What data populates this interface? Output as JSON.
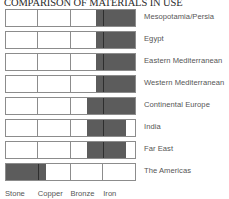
{
  "chart_data": {
    "type": "bar",
    "title": "COMPARISON OF MATERIALS IN USE",
    "xlabel": "",
    "ylabel": "",
    "grid": false,
    "legend_position": "bottom-axis",
    "segment_labels": [
      "Stone",
      "Copper",
      "Bronze",
      "Iron"
    ],
    "categories": [
      "Mesopotamia/Persia",
      "Egypt",
      "Eastern Mediterranean",
      "Western Mediterranean",
      "Continental Europe",
      "India",
      "Far East",
      "The Americas"
    ],
    "axis_range_percent": [
      0,
      100
    ],
    "series": [
      {
        "name": "Iron (dark fill extent, % of bar)",
        "values": [
          {
            "category": "Mesopotamia/Persia",
            "fill_start_pct": 70,
            "fill_end_pct": 100,
            "divider_pct": 75
          },
          {
            "category": "Egypt",
            "fill_start_pct": 70,
            "fill_end_pct": 100,
            "divider_pct": 75
          },
          {
            "category": "Eastern Mediterranean",
            "fill_start_pct": 70,
            "fill_end_pct": 100,
            "divider_pct": 75
          },
          {
            "category": "Western Mediterranean",
            "fill_start_pct": 70,
            "fill_end_pct": 100,
            "divider_pct": 75
          },
          {
            "category": "Continental Europe",
            "fill_start_pct": 63,
            "fill_end_pct": 100,
            "divider_pct": 75
          },
          {
            "category": "India",
            "fill_start_pct": 63,
            "fill_end_pct": 92,
            "divider_pct": 75
          },
          {
            "category": "Far East",
            "fill_start_pct": 63,
            "fill_end_pct": 92,
            "divider_pct": 75
          },
          {
            "category": "The Americas",
            "fill_start_pct": 0,
            "fill_end_pct": 30,
            "divider_pct": 25
          }
        ]
      }
    ],
    "colors": {
      "fill": "#5c5c5c",
      "bar_border": "#8c8c8c",
      "label_text": "#555555",
      "title_text": "#2a2a2a",
      "background": "#ffffff"
    }
  }
}
